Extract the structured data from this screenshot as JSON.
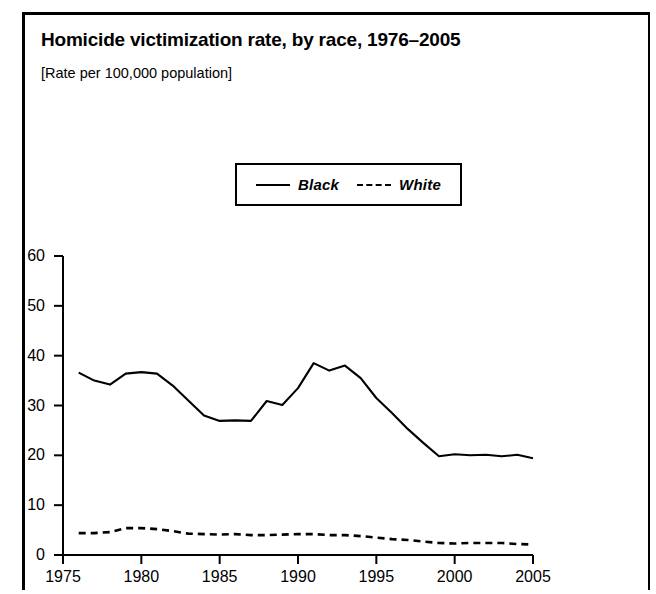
{
  "figure": {
    "title": "Homicide victimization rate, by race, 1976–2005",
    "subtitle": "[Rate per 100,000 population]"
  },
  "chart_data": {
    "type": "line",
    "title": "Homicide victimization rate, by race, 1976–2005",
    "subtitle": "[Rate per 100,000 population]",
    "xlabel": "",
    "ylabel": "",
    "ylim": [
      0,
      60
    ],
    "xlim": [
      1975,
      2005
    ],
    "yticks": [
      0,
      10,
      20,
      30,
      40,
      50,
      60
    ],
    "xticks": [
      1975,
      1980,
      1985,
      1990,
      1995,
      2000,
      2005
    ],
    "grid": false,
    "legend_position": "top-center",
    "x": [
      1976,
      1977,
      1978,
      1979,
      1980,
      1981,
      1982,
      1983,
      1984,
      1985,
      1986,
      1987,
      1988,
      1989,
      1990,
      1991,
      1992,
      1993,
      1994,
      1995,
      1996,
      1997,
      1998,
      1999,
      2000,
      2001,
      2002,
      2003,
      2004,
      2005
    ],
    "series": [
      {
        "name": "Black",
        "style": "solid",
        "color": "#000000",
        "values": [
          36.6,
          35.0,
          34.2,
          36.4,
          36.7,
          36.4,
          34.0,
          31.0,
          28.0,
          26.9,
          27.0,
          26.9,
          30.9,
          30.1,
          33.5,
          38.5,
          37.0,
          38.0,
          35.5,
          31.5,
          28.5,
          25.3,
          22.5,
          19.8,
          20.2,
          20.0,
          20.1,
          19.8,
          20.1,
          19.4
        ]
      },
      {
        "name": "White",
        "style": "dashed",
        "color": "#000000",
        "values": [
          4.4,
          4.4,
          4.6,
          5.4,
          5.4,
          5.2,
          4.8,
          4.3,
          4.2,
          4.1,
          4.2,
          4.0,
          4.0,
          4.1,
          4.2,
          4.2,
          4.0,
          4.0,
          3.8,
          3.5,
          3.2,
          3.0,
          2.7,
          2.4,
          2.3,
          2.4,
          2.4,
          2.4,
          2.2,
          2.1
        ]
      }
    ]
  },
  "legend": {
    "entries": [
      {
        "label": "Black"
      },
      {
        "label": "White"
      }
    ]
  },
  "axes": {
    "y_tick_labels": [
      "60",
      "50",
      "40",
      "30",
      "20",
      "10",
      "0"
    ],
    "x_tick_labels": [
      "1975",
      "1980",
      "1985",
      "1990",
      "1995",
      "2000",
      "2005"
    ]
  }
}
